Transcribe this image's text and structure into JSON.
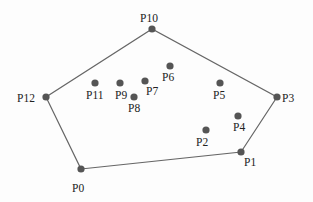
{
  "diagram": {
    "type": "convex-hull",
    "colors": {
      "line": "#666666",
      "point": "#555555",
      "label": "#222222",
      "background": "#fdfdfd"
    },
    "hull_order": [
      "P0",
      "P1",
      "P3",
      "P10",
      "P12"
    ],
    "points": [
      {
        "id": "P0",
        "label": "P0",
        "x": 81,
        "y": 169,
        "lx": 72,
        "ly": 192,
        "hull": true
      },
      {
        "id": "P1",
        "label": "P1",
        "x": 241,
        "y": 152,
        "lx": 244,
        "ly": 166,
        "hull": true
      },
      {
        "id": "P2",
        "label": "P2",
        "x": 206,
        "y": 130,
        "lx": 196,
        "ly": 146,
        "hull": false
      },
      {
        "id": "P3",
        "label": "P3",
        "x": 277,
        "y": 97,
        "lx": 282,
        "ly": 102,
        "hull": true
      },
      {
        "id": "P4",
        "label": "P4",
        "x": 238,
        "y": 116,
        "lx": 233,
        "ly": 131,
        "hull": false
      },
      {
        "id": "P5",
        "label": "P5",
        "x": 220,
        "y": 83,
        "lx": 213,
        "ly": 99,
        "hull": false
      },
      {
        "id": "P6",
        "label": "P6",
        "x": 170,
        "y": 66,
        "lx": 162,
        "ly": 81,
        "hull": false
      },
      {
        "id": "P7",
        "label": "P7",
        "x": 145,
        "y": 81,
        "lx": 146,
        "ly": 95,
        "hull": false
      },
      {
        "id": "P8",
        "label": "P8",
        "x": 134,
        "y": 97,
        "lx": 128,
        "ly": 112,
        "hull": false
      },
      {
        "id": "P9",
        "label": "P9",
        "x": 120,
        "y": 83,
        "lx": 115,
        "ly": 99,
        "hull": false
      },
      {
        "id": "P10",
        "label": "P10",
        "x": 152,
        "y": 29,
        "lx": 140,
        "ly": 22,
        "hull": true
      },
      {
        "id": "P11",
        "label": "P11",
        "x": 95,
        "y": 83,
        "lx": 86,
        "ly": 99,
        "hull": false
      },
      {
        "id": "P12",
        "label": "P12",
        "x": 46,
        "y": 97,
        "lx": 17,
        "ly": 102,
        "hull": true
      }
    ]
  }
}
